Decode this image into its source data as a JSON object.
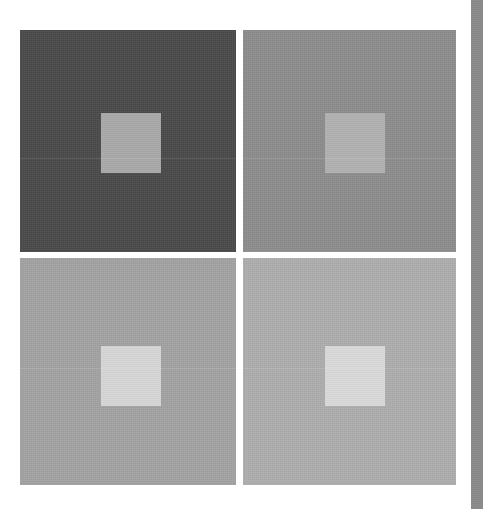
{
  "figure": {
    "caption": "",
    "background_color": "#ffffff",
    "layout": {
      "rows": 2,
      "columns": 2,
      "gutter_px": 7
    }
  },
  "panels": [
    {
      "id": "top-left",
      "position": "top-left",
      "surround_color": "#4a4a4a",
      "patch_color": "#a8a8a8",
      "surround_label": "dark surround",
      "patch_label": "gray test patch"
    },
    {
      "id": "top-right",
      "position": "top-right",
      "surround_color": "#8d8d8d",
      "patch_color": "#b0b0b0",
      "surround_label": "medium surround",
      "patch_label": "gray test patch"
    },
    {
      "id": "bottom-left",
      "position": "bottom-left",
      "surround_color": "#a3a3a3",
      "patch_color": "#d5d5d5",
      "surround_label": "light surround",
      "patch_label": "gray test patch"
    },
    {
      "id": "bottom-right",
      "position": "bottom-right",
      "surround_color": "#aeaeae",
      "patch_color": "#d8d8d8",
      "surround_label": "lighter surround",
      "patch_label": "gray test patch"
    }
  ],
  "edge_bar": {
    "label": "page-gutter-bar",
    "color": "#8a8a8a"
  }
}
